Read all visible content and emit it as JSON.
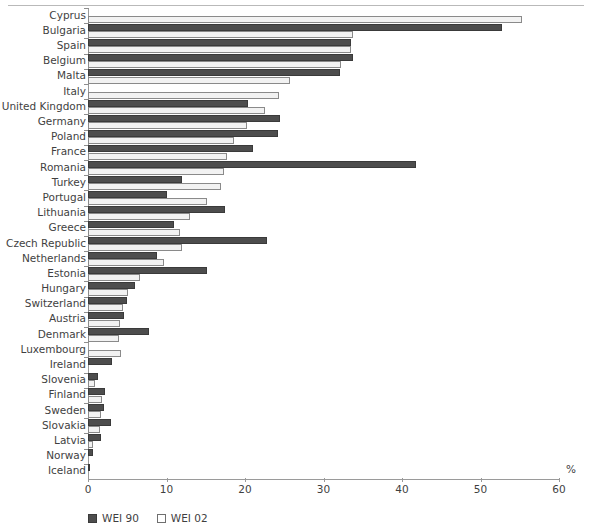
{
  "chart_data": {
    "type": "bar",
    "orientation": "horizontal",
    "title": "",
    "xlabel": "%",
    "ylabel": "",
    "xlim": [
      0,
      60
    ],
    "xticks": [
      0,
      10,
      20,
      30,
      40,
      50,
      60
    ],
    "xtick_labels": [
      "0",
      "10",
      "20",
      "30",
      "40",
      "50",
      "60"
    ],
    "grid": false,
    "legend_position": "bottom-left",
    "categories": [
      "Cyprus",
      "Bulgaria",
      "Spain",
      "Belgium",
      "Malta",
      "Italy",
      "United Kingdom",
      "Germany",
      "Poland",
      "France",
      "Romania",
      "Turkey",
      "Portugal",
      "Lithuania",
      "Greece",
      "Czech Republic",
      "Netherlands",
      "Estonia",
      "Hungary",
      "Switzerland",
      "Austria",
      "Denmark",
      "Luxembourg",
      "Ireland",
      "Slovenia",
      "Finland",
      "Sweden",
      "Slovakia",
      "Latvia",
      "Norway",
      "Iceland"
    ],
    "series": [
      {
        "name": "WEI 90",
        "color": "#4d4d4d",
        "values": [
          0.0,
          52.7,
          33.5,
          33.8,
          32.1,
          0.0,
          20.4,
          24.5,
          24.2,
          21.0,
          41.8,
          12.0,
          10.0,
          17.5,
          11.0,
          22.8,
          8.8,
          15.2,
          6.0,
          5.0,
          4.6,
          7.8,
          0.0,
          3.0,
          1.3,
          2.2,
          2.0,
          2.9,
          1.6,
          0.6,
          0.1
        ]
      },
      {
        "name": "WEI 02",
        "color": "#f2f2f2",
        "values": [
          55.3,
          33.8,
          33.5,
          32.2,
          25.7,
          24.3,
          22.6,
          20.2,
          18.6,
          17.7,
          17.3,
          17.0,
          15.1,
          13.0,
          11.7,
          12.0,
          9.7,
          6.6,
          5.1,
          4.5,
          4.1,
          4.0,
          4.2,
          0.0,
          0.9,
          1.8,
          1.7,
          1.5,
          0.6,
          0.0,
          0.0
        ]
      }
    ]
  },
  "legend": {
    "entries": [
      {
        "label": "WEI 90",
        "swatch": "filled-dark-square"
      },
      {
        "label": "WEI 02",
        "swatch": "outline-white-square"
      }
    ]
  },
  "axis": {
    "unit": "%"
  }
}
